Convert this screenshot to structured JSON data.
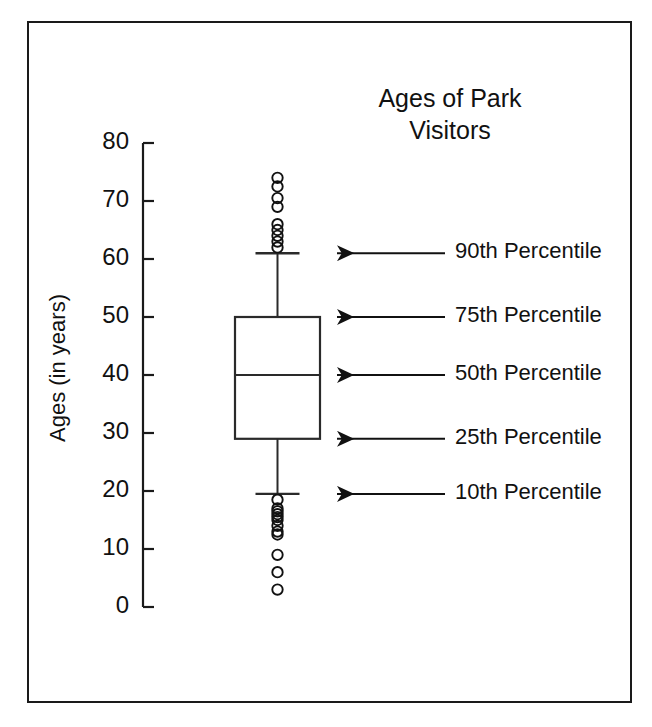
{
  "chart_data": {
    "type": "box",
    "title_line1": "Ages of Park",
    "title_line2": "Visitors",
    "xlabel": "",
    "ylabel": "Ages (in years)",
    "ylim": [
      0,
      80
    ],
    "ytick_values": [
      80,
      70,
      60,
      50,
      40,
      30,
      20,
      10,
      0
    ],
    "ytick_labels": [
      "80",
      "70",
      "60",
      "50",
      "40",
      "30",
      "20",
      "10",
      "0"
    ],
    "grid": false,
    "legend": "none",
    "categories": [
      "Park Visitors"
    ],
    "boxes": [
      {
        "name": "Park Visitors",
        "p10": 19.5,
        "q1": 29,
        "median": 40,
        "q3": 50,
        "p90": 61,
        "whisker_low": 19.5,
        "whisker_high": 61,
        "outliers_high": [
          74,
          72.5,
          70.5,
          69,
          66,
          65,
          64,
          63,
          62
        ],
        "outliers_low": [
          18.5,
          17,
          16.5,
          16,
          15.5,
          15,
          14,
          13,
          12.5,
          9,
          6,
          3
        ]
      }
    ],
    "annotations": [
      {
        "label": "90th Percentile",
        "value": 61
      },
      {
        "label": "75th Percentile",
        "value": 50
      },
      {
        "label": "50th Percentile",
        "value": 40
      },
      {
        "label": "25th Percentile",
        "value": 29
      },
      {
        "label": "10th Percentile",
        "value": 19.5
      }
    ],
    "colors": {
      "ink": "#111111",
      "frame": "#1a1a1a",
      "background": "#ffffff"
    }
  }
}
